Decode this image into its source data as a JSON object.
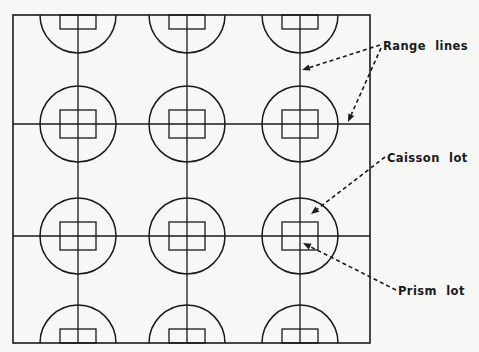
{
  "diagram": {
    "type": "site-layout-grid",
    "frame": {
      "x": 13,
      "y": 15,
      "width": 357,
      "height": 328
    },
    "range_lines": {
      "vertical_x": [
        78,
        187,
        300
      ],
      "horizontal_y": [
        124,
        236
      ]
    },
    "caisson_lots": {
      "radius": 38,
      "rows": [
        {
          "cy": 15,
          "shape": "half-circle-bottom"
        },
        {
          "cy": 124,
          "shape": "full-circle"
        },
        {
          "cy": 236,
          "shape": "full-circle"
        },
        {
          "cy": 343,
          "shape": "half-circle-top"
        }
      ],
      "columns_x": [
        78,
        187,
        300
      ]
    },
    "prism_lots": {
      "width": 36,
      "height": 28
    },
    "labels": [
      {
        "id": "range-lines",
        "text": "Range lines",
        "x": 383,
        "y": 50
      },
      {
        "id": "caisson-lot",
        "text": "Caisson lot",
        "x": 387,
        "y": 162
      },
      {
        "id": "prism-lot",
        "text": "Prism lot",
        "x": 398,
        "y": 295
      }
    ],
    "leaders": [
      {
        "for": "range-lines",
        "from": [
          380,
          45
        ],
        "to": [
          302,
          70
        ]
      },
      {
        "for": "range-lines",
        "from": [
          381,
          48
        ],
        "to": [
          348,
          122
        ]
      },
      {
        "for": "caisson-lot",
        "from": [
          385,
          157
        ],
        "to": [
          311,
          214
        ]
      },
      {
        "for": "prism-lot",
        "from": [
          396,
          290
        ],
        "to": [
          303,
          243
        ]
      }
    ]
  }
}
